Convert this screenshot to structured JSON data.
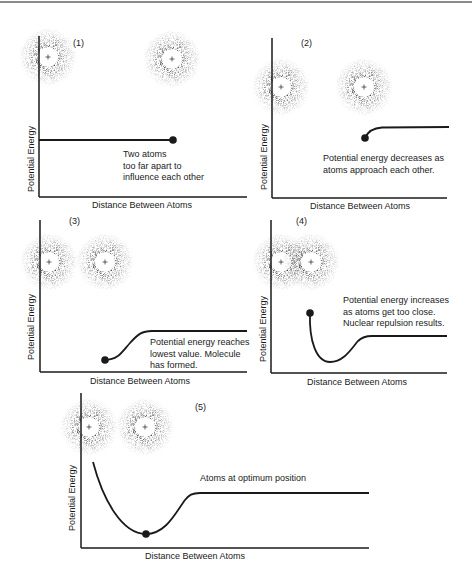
{
  "figure": {
    "type": "potential energy diagram sequence",
    "panels": [
      {
        "id": "1",
        "label": "(1)",
        "ylabel": "Potential Energy",
        "xlabel": "Distance Between Atoms",
        "annotation": [
          "Two atoms",
          "too far apart to",
          "influence each other"
        ],
        "atom_separation": "far"
      },
      {
        "id": "2",
        "label": "(2)",
        "ylabel": "Potential Energy",
        "xlabel": "Distance Between Atoms",
        "annotation": [
          "Potential energy decreases as",
          "atoms approach each other."
        ],
        "atom_separation": "approaching"
      },
      {
        "id": "3",
        "label": "(3)",
        "ylabel": "Potential Energy",
        "xlabel": "Distance Between Atoms",
        "annotation": [
          "Potential energy reaches",
          "lowest value. Molecule",
          "has formed."
        ],
        "atom_separation": "bond length"
      },
      {
        "id": "4",
        "label": "(4)",
        "ylabel": "Potential Energy",
        "xlabel": "Distance Between Atoms",
        "annotation": [
          "Potential energy increases",
          "as atoms get too close.",
          "Nuclear repulsion results."
        ],
        "atom_separation": "too close"
      },
      {
        "id": "5",
        "label": "(5)",
        "ylabel": "Potential Energy",
        "xlabel": "Distance Between Atoms",
        "annotation": [
          "Atoms at optimum position"
        ],
        "atom_separation": "optimum"
      }
    ],
    "nucleus_symbol": "+",
    "colors": {
      "ink": "#1a1a1a",
      "background": "#ffffff",
      "rule": "#8a8a8a"
    }
  }
}
